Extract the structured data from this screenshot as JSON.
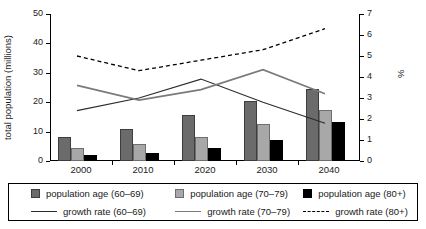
{
  "chart_data": {
    "type": "bar",
    "title": "",
    "subtitle": "",
    "xlabel": "",
    "ylabel": "total population (millions)",
    "y2label": "%",
    "categories": [
      "2000",
      "2010",
      "2020",
      "2030",
      "2040"
    ],
    "ylim": [
      0,
      50
    ],
    "y2lim": [
      0,
      7
    ],
    "yticks": [
      "0",
      "10",
      "20",
      "30",
      "40",
      "50"
    ],
    "y2ticks": [
      "0",
      "1",
      "2",
      "3",
      "4",
      "5",
      "6",
      "7"
    ],
    "grid": false,
    "legend_position": "bottom",
    "bar_series": [
      {
        "name": "population age (60–69)",
        "color": "#6b6b6b",
        "axis": "left",
        "values": [
          8.3,
          10.8,
          15.7,
          20.5,
          24.5
        ]
      },
      {
        "name": "population age (70–79)",
        "color": "#a8a8a8",
        "axis": "left",
        "values": [
          4.4,
          5.8,
          8.3,
          12.5,
          17.2
        ]
      },
      {
        "name": "population age (80+)",
        "color": "#000000",
        "axis": "left",
        "values": [
          1.9,
          2.7,
          4.3,
          7.2,
          13.3
        ]
      }
    ],
    "line_series": [
      {
        "name": "growth rate (60–69)",
        "color": "#2b2b2b",
        "style": "solid",
        "axis": "right",
        "values": [
          2.4,
          3.0,
          3.9,
          2.8,
          1.8
        ]
      },
      {
        "name": "growth rate (70–79)",
        "color": "#7a7a7a",
        "style": "solid",
        "axis": "right",
        "values": [
          3.6,
          2.9,
          3.4,
          4.35,
          3.2
        ]
      },
      {
        "name": "growth rate (80+)",
        "color": "#000000",
        "style": "dashed",
        "axis": "right",
        "values": [
          5.0,
          4.3,
          4.8,
          5.3,
          6.3
        ]
      }
    ]
  },
  "legend": {
    "bars": [
      "population age (60–69)",
      "population age (70–79)",
      "population age (80+)"
    ],
    "lines": [
      "growth rate (60–69)",
      "growth rate (70–79)",
      "growth rate (80+)"
    ]
  }
}
